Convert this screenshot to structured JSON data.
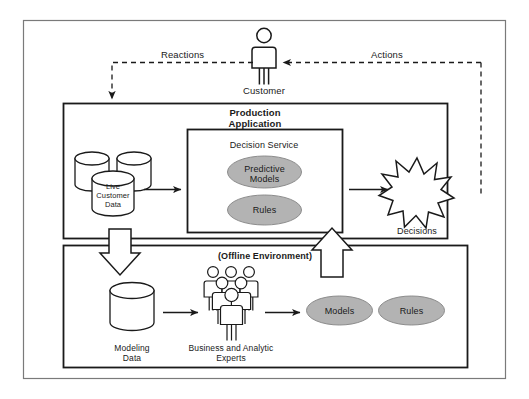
{
  "diagram": {
    "colors": {
      "stroke": "#1a1a1a",
      "ellipse_fill": "#b3b3b3",
      "ellipse_stroke": "#8c8c8c",
      "frame": "#7a7a7a",
      "background": "#ffffff"
    }
  },
  "actor": {
    "label": "Customer",
    "icon": "person-icon"
  },
  "flows": {
    "reactions_label": "Reactions",
    "actions_label": "Actions"
  },
  "production_panel": {
    "title_line1": "Production",
    "title_line2": "Application",
    "data_store": {
      "label_line1": "Live",
      "label_line2": "Customer",
      "label_line3": "Data",
      "icon": "database-cylinder-icon",
      "count": 3
    },
    "decision_service": {
      "title": "Decision Service",
      "components": [
        {
          "label_line1": "Predictive",
          "label_line2": "Models"
        },
        {
          "label_line1": "Rules",
          "label_line2": ""
        }
      ]
    },
    "output": {
      "label": "Decisions",
      "icon": "starburst-icon"
    }
  },
  "offline_panel": {
    "title": "(Offline Environment)",
    "data_store": {
      "label_line1": "Modeling",
      "label_line2": "Data",
      "icon": "database-cylinder-icon"
    },
    "experts": {
      "label_line1": "Business and Analytic",
      "label_line2": "Experts",
      "icon": "people-group-icon"
    },
    "artifacts": [
      {
        "label": "Models"
      },
      {
        "label": "Rules"
      }
    ]
  }
}
